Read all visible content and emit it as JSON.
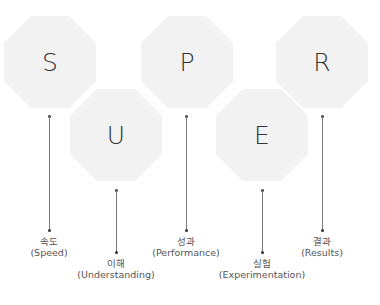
{
  "diagram": {
    "items": [
      {
        "letter": "S",
        "korean": "속도",
        "english": "(Speed)"
      },
      {
        "letter": "U",
        "korean": "이해",
        "english": "(Understanding)"
      },
      {
        "letter": "P",
        "korean": "성과",
        "english": "(Performance)"
      },
      {
        "letter": "E",
        "korean": "실험",
        "english": "(Experimentation)"
      },
      {
        "letter": "R",
        "korean": "결과",
        "english": "(Results)"
      }
    ],
    "colors": {
      "octagon_fill": "#f2f2f2",
      "letter": "#333333",
      "connector": "#777777",
      "label": "#555555"
    }
  }
}
